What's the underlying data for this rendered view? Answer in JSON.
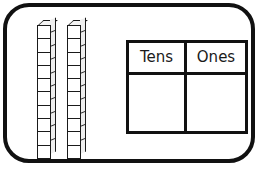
{
  "worksheet": {
    "title": "Base-ten blocks place value worksheet",
    "background_color": "#ffffff",
    "frame": {
      "name": "rounded-border-frame",
      "border_color": "#111111",
      "corner_radius_px": 26
    }
  },
  "manipulatives": {
    "label": "base-ten-rods",
    "rod_count": 2,
    "cubes_per_rod": 10,
    "total_value": 20,
    "rods": [
      {
        "id": "rod-1",
        "units": 10,
        "value": 10
      },
      {
        "id": "rod-2",
        "units": 10,
        "value": 10
      }
    ]
  },
  "place_value_table": {
    "type": "table",
    "columns": [
      "Tens",
      "Ones"
    ],
    "headers": {
      "tens": "Tens",
      "ones": "Ones"
    },
    "rows": [
      {
        "tens": "",
        "ones": ""
      }
    ],
    "border_color": "#111111",
    "cell_background": "#ffffff"
  }
}
